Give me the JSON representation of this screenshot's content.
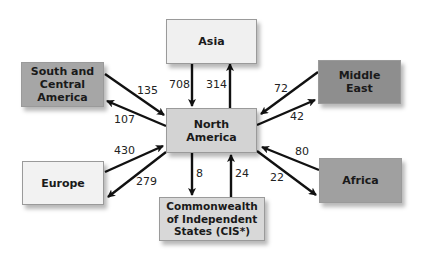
{
  "diagram": {
    "title": "",
    "center": {
      "id": "north-america",
      "label": "North\nAmerica",
      "color": "#d3d3d3"
    },
    "regions": [
      {
        "id": "asia",
        "label": "Asia",
        "color": "#f0f0f0"
      },
      {
        "id": "south-central-america",
        "label": "South and\nCentral\nAmerica",
        "color": "#a6a6a6"
      },
      {
        "id": "middle-east",
        "label": "Middle\nEast",
        "color": "#8e8e8e"
      },
      {
        "id": "europe",
        "label": "Europe",
        "color": "#f2f2f2"
      },
      {
        "id": "cis",
        "label": "Commonwealth\nof Independent\nStates (CIS*)",
        "color": "#d8d8d8"
      },
      {
        "id": "africa",
        "label": "Africa",
        "color": "#a0a0a0"
      }
    ],
    "flows": [
      {
        "from": "asia",
        "to": "north-america",
        "value": "708"
      },
      {
        "from": "north-america",
        "to": "asia",
        "value": "314"
      },
      {
        "from": "south-central-america",
        "to": "north-america",
        "value": "135"
      },
      {
        "from": "north-america",
        "to": "south-central-america",
        "value": "107"
      },
      {
        "from": "middle-east",
        "to": "north-america",
        "value": "72"
      },
      {
        "from": "north-america",
        "to": "middle-east",
        "value": "42"
      },
      {
        "from": "europe",
        "to": "north-america",
        "value": "430"
      },
      {
        "from": "north-america",
        "to": "europe",
        "value": "279"
      },
      {
        "from": "north-america",
        "to": "cis",
        "value": "8"
      },
      {
        "from": "cis",
        "to": "north-america",
        "value": "24"
      },
      {
        "from": "africa",
        "to": "north-america",
        "value": "80"
      },
      {
        "from": "north-america",
        "to": "africa",
        "value": "22"
      }
    ]
  }
}
